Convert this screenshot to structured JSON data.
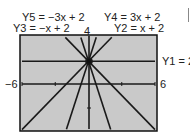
{
  "chart_data": {
    "type": "line",
    "title": "",
    "xlabel": "",
    "ylabel": "",
    "xlim": [
      -6,
      6
    ],
    "ylim": [
      -4,
      4
    ],
    "tick_labels": {
      "x_min": "-6",
      "x_max": "6",
      "y_max": "4"
    },
    "grid": false,
    "series": [
      {
        "name": "Y1 = 2",
        "slope": 0,
        "intercept": 2
      },
      {
        "name": "Y2 = x + 2",
        "slope": 1,
        "intercept": 2
      },
      {
        "name": "Y3 = -x + 2",
        "slope": -1,
        "intercept": 2
      },
      {
        "name": "Y4 = 3x + 2",
        "slope": 3,
        "intercept": 2
      },
      {
        "name": "Y5 = -3x + 2",
        "slope": -3,
        "intercept": 2
      }
    ]
  },
  "labels": {
    "y5": "Y5 = −3x + 2",
    "y4": "Y4 = 3x + 2",
    "y3": "Y3 = −x + 2",
    "y2": "Y2 = x + 2",
    "y1": "Y1 = 2",
    "xmin": "−6",
    "xmax": "6",
    "ymax": "4"
  },
  "colors": {
    "screen": "#c8c8c8",
    "line": "#1a1a1a"
  }
}
